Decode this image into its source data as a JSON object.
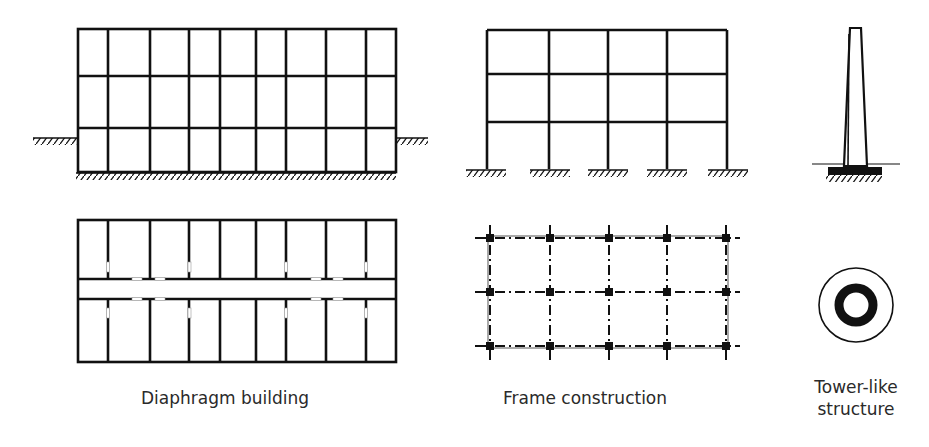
{
  "labels": {
    "diaphragm": "Diaphragm building",
    "frame": "Frame construction",
    "tower_line1": "Tower-like",
    "tower_line2": "structure"
  },
  "colors": {
    "ink": "#111111",
    "background": "#ffffff",
    "text": "#2a2a2a"
  },
  "diagrams": [
    {
      "id": "diaphragm-elevation",
      "rows": 3,
      "columns": 9
    },
    {
      "id": "diaphragm-plan",
      "rows": 2,
      "columns": 9,
      "corridor": true
    },
    {
      "id": "frame-elevation",
      "rows": 3,
      "bays": 4
    },
    {
      "id": "frame-plan",
      "grid": "5x3 columns with dash-dot axes"
    },
    {
      "id": "tower-elevation"
    },
    {
      "id": "tower-plan"
    }
  ]
}
